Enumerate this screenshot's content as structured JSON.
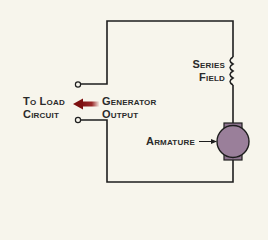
{
  "diagram": {
    "labels": {
      "to_load_line1": "To Load",
      "to_load_line2": "Circuit",
      "generator_line1": "Generator",
      "generator_line2": "Output",
      "series_line1": "Series",
      "series_line2": "Field",
      "armature": "Armature"
    },
    "colors": {
      "background": "#f7f5ec",
      "wire": "#1e1e1e",
      "armature_fill": "#9a7f9a",
      "armature_brush": "#8f7590",
      "arrow": "#8b1a1a",
      "text": "#2a2a2a"
    }
  }
}
